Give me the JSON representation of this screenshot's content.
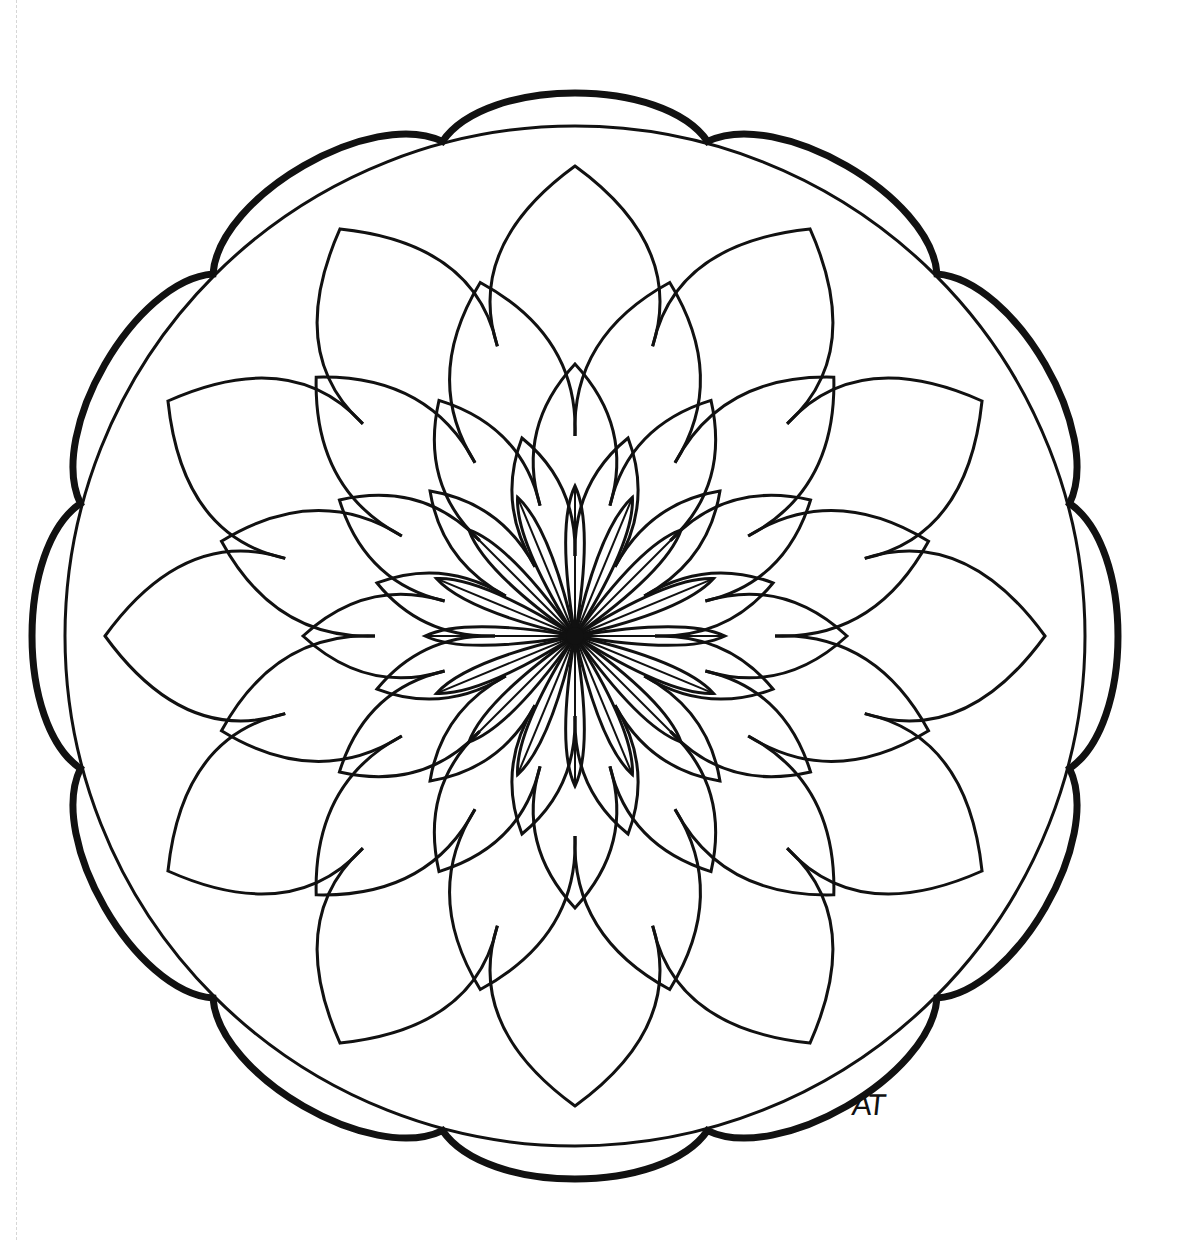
{
  "artwork": {
    "title": "Mandala coloring page",
    "signature": "AT",
    "stroke_color": "#111111",
    "background_color": "#ffffff",
    "center": [
      575,
      636
    ],
    "outer_circle_radius": 510,
    "scallop_lobes": 12,
    "petal_rings": [
      {
        "count": 12,
        "tip_r": 470,
        "base_r": 300,
        "rotation": 0,
        "width": 0.55
      },
      {
        "count": 12,
        "tip_r": 366,
        "base_r": 200,
        "rotation": 15,
        "width": 0.55
      },
      {
        "count": 12,
        "tip_r": 272,
        "base_r": 135,
        "rotation": 0,
        "width": 0.55
      },
      {
        "count": 12,
        "tip_r": 205,
        "base_r": 80,
        "rotation": 15,
        "width": 0.55
      },
      {
        "count": 16,
        "tip_r": 150,
        "base_r": 0,
        "rotation": 0,
        "width": 0.5
      }
    ],
    "spokes": 16
  }
}
